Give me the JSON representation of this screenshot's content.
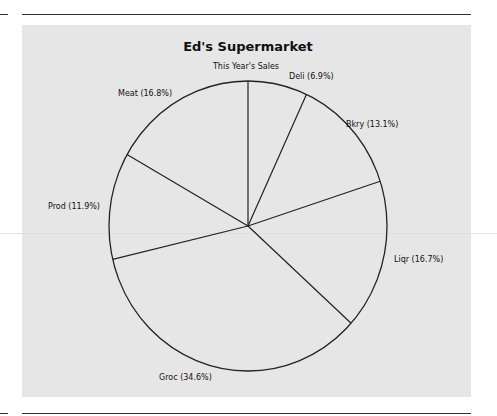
{
  "chart_data": {
    "type": "pie",
    "title": "Ed's Supermarket",
    "subtitle": "This Year's Sales",
    "start_angle": "top (12 o'clock)",
    "direction": "clockwise",
    "categories": [
      "Deli",
      "Bkry",
      "Liqr",
      "Groc",
      "Prod",
      "Meat"
    ],
    "values": [
      6.9,
      13.1,
      16.7,
      34.6,
      11.9,
      16.8
    ],
    "unit": "%",
    "labels": [
      "Deli (6.9%)",
      "Bkry (13.1%)",
      "Liqr (16.7%)",
      "Groc (34.6%)",
      "Prod (11.9%)",
      "Meat (16.8%)"
    ],
    "colors": {
      "background_panel": "#e6e6e6",
      "stroke": "#222222",
      "text": "#111111"
    }
  }
}
